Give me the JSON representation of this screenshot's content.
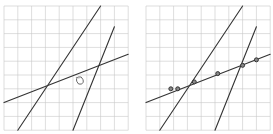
{
  "figure": {
    "grid_color": "#c8c8c8",
    "line_color": "#333333",
    "point_color": "#333333",
    "panels": [
      {
        "id": "left",
        "lines": [
          {
            "name": "steep-line-1",
            "from": [
              1,
              0
            ],
            "to": [
              7,
              9
            ]
          },
          {
            "name": "steep-line-2",
            "from": [
              5,
              0
            ],
            "to": [
              8,
              7.5
            ]
          },
          {
            "name": "shallow-line",
            "from": [
              0,
              2
            ],
            "to": [
              9,
              5.5
            ]
          }
        ],
        "marks": [
          {
            "name": "circled-mark",
            "at": [
              5.5,
              3.6
            ]
          }
        ]
      },
      {
        "id": "right",
        "lines": [
          {
            "name": "steep-line-1",
            "from": [
              1,
              0
            ],
            "to": [
              7,
              9
            ]
          },
          {
            "name": "steep-line-2",
            "from": [
              5,
              0
            ],
            "to": [
              8,
              7.5
            ]
          },
          {
            "name": "shallow-line",
            "from": [
              0,
              2
            ],
            "to": [
              9,
              5.5
            ]
          }
        ],
        "points": [
          [
            1.8,
            3.0
          ],
          [
            2.3,
            3.0
          ],
          [
            3.5,
            3.5
          ],
          [
            5.2,
            4.1
          ],
          [
            7.0,
            4.7
          ],
          [
            8.0,
            5.1
          ]
        ]
      }
    ]
  }
}
